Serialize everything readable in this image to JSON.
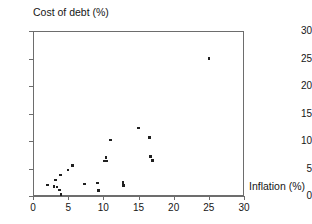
{
  "chart_data": {
    "type": "scatter",
    "title": "",
    "xlabel": "Inflation (%)",
    "ylabel": "Cost of debt (%)",
    "xlim": [
      0,
      30
    ],
    "ylim": [
      0,
      30
    ],
    "xticks": [
      0,
      5,
      10,
      15,
      20,
      25,
      30
    ],
    "yticks": [
      0,
      5,
      10,
      15,
      20,
      25,
      30
    ],
    "xtick_labels": [
      "0",
      "5",
      "10",
      "15",
      "20",
      "25",
      "30"
    ],
    "ytick_labels": [
      "0",
      "5",
      "10",
      "15",
      "20",
      "25",
      "30"
    ],
    "grid": false,
    "legend": false,
    "marker_color": "#202020",
    "axis_color": "#6d6d6d",
    "points": [
      {
        "x": 2.1,
        "y": 2.0
      },
      {
        "x": 3.2,
        "y": 2.9
      },
      {
        "x": 3.0,
        "y": 1.7
      },
      {
        "x": 3.4,
        "y": 1.6
      },
      {
        "x": 3.9,
        "y": 3.8
      },
      {
        "x": 3.8,
        "y": 1.1
      },
      {
        "x": 4.0,
        "y": 0.3
      },
      {
        "x": 5.0,
        "y": 4.7
      },
      {
        "x": 5.6,
        "y": 5.5
      },
      {
        "x": 7.3,
        "y": 2.2
      },
      {
        "x": 9.2,
        "y": 2.4
      },
      {
        "x": 9.3,
        "y": 1.0
      },
      {
        "x": 10.4,
        "y": 7.0
      },
      {
        "x": 10.2,
        "y": 6.4
      },
      {
        "x": 10.5,
        "y": 6.4
      },
      {
        "x": 11.0,
        "y": 10.2
      },
      {
        "x": 12.8,
        "y": 2.5
      },
      {
        "x": 12.9,
        "y": 1.9
      },
      {
        "x": 15.0,
        "y": 12.4
      },
      {
        "x": 16.6,
        "y": 10.6
      },
      {
        "x": 16.7,
        "y": 7.2
      },
      {
        "x": 17.0,
        "y": 6.5
      },
      {
        "x": 25.0,
        "y": 25.0
      }
    ]
  }
}
